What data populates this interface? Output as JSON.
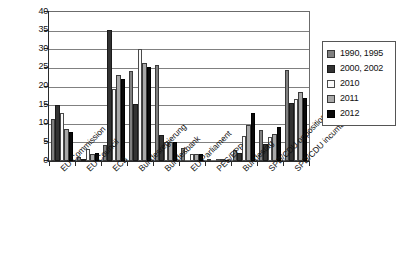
{
  "chart_data": {
    "type": "bar",
    "title": "",
    "subtitle": "",
    "xlabel": "",
    "ylabel": "",
    "ylim": [
      0,
      40
    ],
    "ytick_step": 5,
    "yticks": [
      "0",
      "5",
      "10",
      "15",
      "20",
      "25",
      "30",
      "35",
      "40"
    ],
    "grid": true,
    "legend_position": "right",
    "categories": [
      "EU Commission",
      "EU Council",
      "ECB",
      "Bundesregierung",
      "Bundesbank",
      "EU Parliament",
      "PES/EPP",
      "Bundestag",
      "SPD/CDU opposition",
      "SPD/CDU incumbent"
    ],
    "series": [
      {
        "name": "1990, 1995",
        "color": "#808080",
        "values": [
          11.2,
          1.0,
          4.3,
          24.1,
          25.7,
          3.4,
          0.4,
          3.0,
          8.2,
          24.4
        ]
      },
      {
        "name": "2000, 2002",
        "color": "#333333",
        "values": [
          15.0,
          0.4,
          35.1,
          15.2,
          7.0,
          0.0,
          0.0,
          2.2,
          4.5,
          15.5
        ]
      },
      {
        "name": "2010",
        "color": "#fbfbfb",
        "values": [
          13.0,
          3.2,
          19.4,
          30.1,
          5.1,
          1.9,
          0.4,
          6.8,
          6.4,
          16.6
        ]
      },
      {
        "name": "2011",
        "color": "#a8a8a8",
        "values": [
          8.5,
          1.9,
          23.2,
          26.3,
          5.0,
          1.9,
          0.4,
          9.8,
          7.2,
          18.5
        ]
      },
      {
        "name": "2012",
        "color": "#0a0a0a",
        "values": [
          7.7,
          2.1,
          22.0,
          25.2,
          5.2,
          1.9,
          0.3,
          12.9,
          9.0,
          16.9
        ]
      }
    ]
  },
  "legend": {
    "entries": [
      {
        "label": "1990, 1995",
        "swatch": "legend-swatch-1990-1995"
      },
      {
        "label": "2000, 2002",
        "swatch": "legend-swatch-2000-2002"
      },
      {
        "label": "2010",
        "swatch": "legend-swatch-2010"
      },
      {
        "label": "2011",
        "swatch": "legend-swatch-2011"
      },
      {
        "label": "2012",
        "swatch": "legend-swatch-2012"
      }
    ]
  }
}
